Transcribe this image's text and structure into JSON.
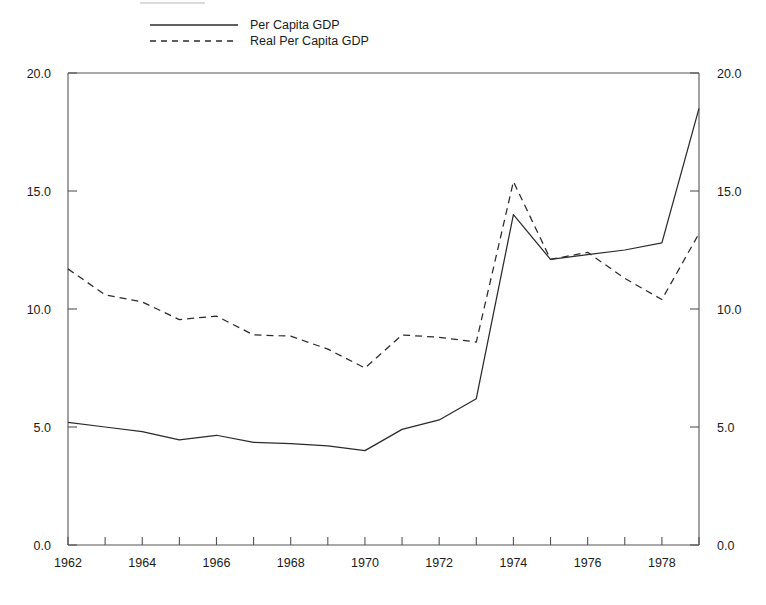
{
  "chart_data": {
    "type": "line",
    "title": "",
    "subtitle": "",
    "xlabel": "",
    "ylabel": "",
    "x": [
      1962,
      1963,
      1964,
      1965,
      1966,
      1967,
      1968,
      1969,
      1970,
      1971,
      1972,
      1973,
      1974,
      1975,
      1976,
      1977,
      1978,
      1979
    ],
    "xlim": [
      1962,
      1979
    ],
    "ylim": [
      0.0,
      20.0
    ],
    "grid": false,
    "legend_position": "top-left",
    "x_tick_values": [
      1962,
      1963,
      1964,
      1965,
      1966,
      1967,
      1968,
      1969,
      1970,
      1971,
      1972,
      1973,
      1974,
      1975,
      1976,
      1977,
      1978,
      1979
    ],
    "x_tick_labels": [
      "1962",
      "",
      "1964",
      "",
      "1966",
      "",
      "1968",
      "",
      "1970",
      "",
      "1972",
      "",
      "1974",
      "",
      "1976",
      "",
      "1978",
      ""
    ],
    "y_tick_values": [
      0.0,
      5.0,
      10.0,
      15.0,
      20.0
    ],
    "y_tick_labels": [
      "0.0",
      "5.0",
      "10.0",
      "15.0",
      "20.0"
    ],
    "y_tick_labels_right": [
      "0.0",
      "5.0",
      "10.0",
      "15.0",
      "20.0"
    ],
    "series": [
      {
        "name": "Per Capita GDP",
        "style": "solid",
        "color": "#2b2b2b",
        "values": [
          5.2,
          5.0,
          4.8,
          4.45,
          4.65,
          4.35,
          4.3,
          4.2,
          4.0,
          4.9,
          5.3,
          6.2,
          14.0,
          12.1,
          12.3,
          12.5,
          12.8,
          18.5
        ]
      },
      {
        "name": "Real Per Capita GDP",
        "style": "dashed",
        "color": "#2b2b2b",
        "values": [
          11.7,
          10.6,
          10.3,
          9.55,
          9.7,
          8.9,
          8.85,
          8.3,
          7.5,
          8.9,
          8.8,
          8.6,
          15.4,
          12.1,
          12.4,
          11.3,
          10.4,
          13.2
        ]
      }
    ]
  },
  "legend": {
    "entries": [
      {
        "label": "Per Capita GDP",
        "style": "solid"
      },
      {
        "label": "Real Per Capita GDP",
        "style": "dashed"
      }
    ]
  },
  "axes": {
    "left": {
      "labels": [
        "20.0",
        "15.0",
        "10.0",
        "5.0",
        "0.0"
      ]
    },
    "right": {
      "labels": [
        "20.0",
        "15.0",
        "10.0",
        "5.0",
        "0.0"
      ]
    },
    "bottom": {
      "labels": [
        "1962",
        "1964",
        "1966",
        "1968",
        "1970",
        "1972",
        "1974",
        "1976",
        "1978"
      ]
    }
  }
}
